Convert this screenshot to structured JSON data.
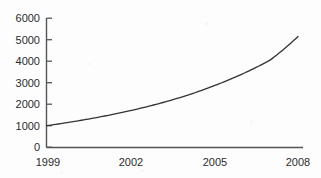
{
  "chart_data": {
    "type": "line",
    "title": "",
    "xlabel": "",
    "ylabel": "",
    "x": [
      1999,
      2000,
      2001,
      2002,
      2003,
      2004,
      2005,
      2006,
      2007,
      2008
    ],
    "values": [
      1000,
      1200,
      1430,
      1700,
      2020,
      2400,
      2860,
      3400,
      4050,
      5150
    ],
    "series": [
      {
        "name": "",
        "values": [
          1000,
          1200,
          1430,
          1700,
          2020,
          2400,
          2860,
          3400,
          4050,
          5150
        ]
      }
    ],
    "xlim": [
      1999,
      2008
    ],
    "ylim": [
      0,
      6000
    ],
    "ytick_values": [
      0,
      1000,
      2000,
      3000,
      4000,
      5000,
      6000
    ],
    "xtick_values": [
      1999,
      2002,
      2005,
      2008
    ],
    "grid": false,
    "legend": false,
    "line_color": "#333333"
  },
  "axes": {
    "y_labels": [
      "6000",
      "5000",
      "4000",
      "3000",
      "2000",
      "1000",
      "0"
    ],
    "x_labels": [
      "1999",
      "2002",
      "2005",
      "2008"
    ]
  },
  "colors": {
    "line": "#333333",
    "axis": "#555555",
    "text": "#2b2b2b",
    "background": "#fdfdfd"
  }
}
